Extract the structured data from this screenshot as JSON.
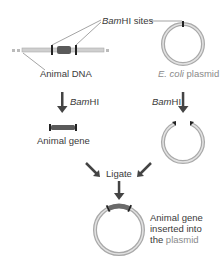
{
  "diagram": {
    "labels": {
      "bamhi_sites_italic": "Bam",
      "bamhi_sites_rest": "HI sites",
      "animal_dna": "Animal DNA",
      "ecoli_italic": "E. coli",
      "ecoli_rest": " plasmid",
      "step1_left_italic": "Bam",
      "step1_left_rest": "HI",
      "step1_right_italic": "Bam",
      "step1_right_rest": "HI",
      "animal_gene": "Animal gene",
      "ligate": "Ligate",
      "result_line1": "Animal gene",
      "result_line2": "inserted into",
      "result_line3_a": "the ",
      "result_line3_b": "plasmid"
    },
    "colors": {
      "dna_strand": "#c8c8c8",
      "gene_segment": "#555555",
      "arrow": "#444444",
      "plasmid_ring": "#a9a9a9",
      "plasmid_ring_inner": "#e2e2e2",
      "cut_site": "#222222"
    }
  }
}
